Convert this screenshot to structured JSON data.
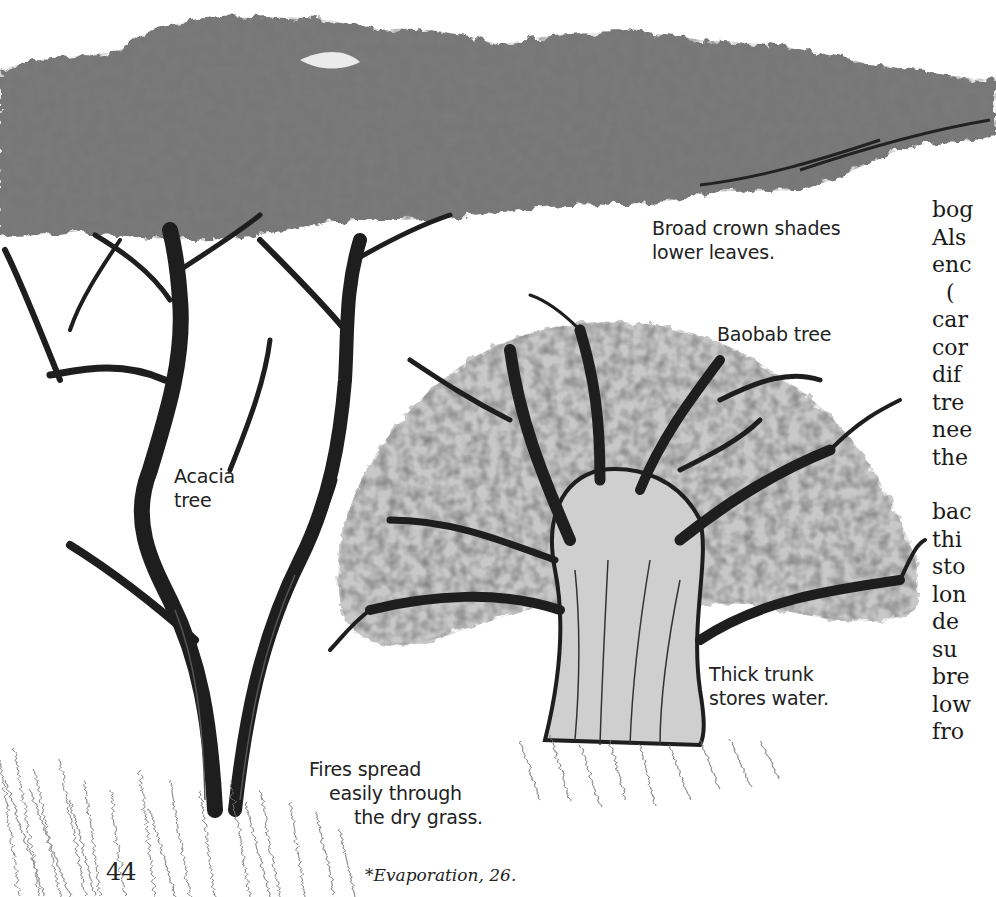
{
  "page": {
    "number": "44",
    "footnote": "*Evaporation, 26."
  },
  "illustration": {
    "trees": [
      "Acacia tree",
      "Baobab tree"
    ],
    "labels": {
      "crown": [
        "Broad crown shades",
        "lower leaves."
      ],
      "baobab": "Baobab tree",
      "acacia": [
        "Acacia",
        "tree"
      ],
      "trunk": [
        "Thick trunk",
        "stores water."
      ],
      "fires": [
        "Fires spread",
        "easily through",
        "the dry grass."
      ]
    },
    "colors": {
      "ink": "#1e1e1e",
      "foliage": "#6e6e6e",
      "foliage_dark": "#3a3a3a",
      "paper": "#ffffff"
    }
  },
  "body_text": {
    "block1": [
      "bog",
      "Als",
      "enc",
      "  (",
      "car",
      "cor",
      "dif",
      "tre",
      "nee",
      "the"
    ],
    "block2": [
      "bac",
      "thi",
      "sto",
      "lon",
      "de",
      "su",
      "bre",
      "low",
      "fro"
    ]
  }
}
